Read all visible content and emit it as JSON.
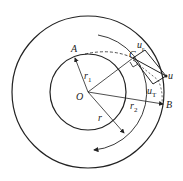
{
  "diagram": {
    "type": "blade-velocity-triangle-on-annulus",
    "labels": {
      "A": "A",
      "B": "B",
      "C": "C",
      "O": "O",
      "r1": "r",
      "r1_sub": "1",
      "r2": "r",
      "r2_sub": "2",
      "r": "r",
      "u": "u",
      "ur": "u",
      "ur_sub": "r",
      "uT": "u",
      "uT_sub": "T"
    },
    "colors": {
      "stroke": "#222222",
      "background": "#ffffff"
    }
  }
}
